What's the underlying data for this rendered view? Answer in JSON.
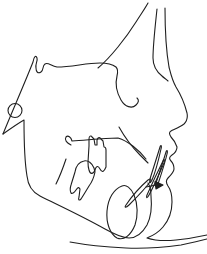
{
  "figure": {
    "kind": "cephalometric-tracing-line-drawing",
    "background_color": "#ffffff",
    "stroke_color": "#1f1f1f",
    "stroke_width": 1.1,
    "width": 207,
    "height": 254,
    "paths": [
      {
        "name": "frontal-bone-inner-curve",
        "d": "M 98 68 C 110 58 126 38 136 22 C 141 14 146 7 148 3"
      },
      {
        "name": "cranial-base-sella-orbital-outline",
        "d": "M 3 134 C 12 112 26 80 33 62 C 34 56 36 55 37 58 C 38 61 35 64 36 68 C 36 72 38 74 41 72 C 44 70 42 66 45 64 C 48 62 51 66 57 67 C 72 67 86 63 100 63 C 107 63 112 64 116 67 C 118 69 118 72 117 76 C 115 84 117 93 121 100 C 125 107 132 109 136 105 C 139 102 139 100 137 98"
      },
      {
        "name": "condyle-ramus-mandible-lower-border",
        "d": "M 3 134 C 10 129 17 124 24 120 C 24 138 24 158 27 176 C 28 186 32 192 40 196 C 58 205 82 216 105 229 C 114 234 122 238 129 238 C 137 238 143 232 147 225 C 151 217 152 206 151 196 C 151 190 150 186 148 183"
      },
      {
        "name": "symphysis-outline",
        "d": "M 122 186 C 114 189 108 198 107 211 C 106 223 110 234 117 238 C 124 241 131 235 135 225 C 138 216 138 204 134 195 C 131 188 126 184 122 186"
      },
      {
        "name": "lower-incisor-outline",
        "d": "M 126 205 C 132 196 140 187 148 180 C 151 178 152 179 150 182 C 145 189 136 198 129 205 C 126 208 124 208 126 205"
      },
      {
        "name": "upper-incisor-outline-a",
        "d": "M 160 147 C 157 157 153 169 150 179 C 149 183 150 184 152 180 C 156 171 159 158 161 149 C 162 146 161 144 160 147"
      },
      {
        "name": "upper-incisor-outline-b",
        "d": "M 166 152 C 163 162 159 174 156 183 C 155 187 156 188 158 184 C 161 175 165 163 167 154 C 168 151 167 149 166 152"
      },
      {
        "name": "lower-incisor-outline-b",
        "d": "M 163 161 C 157 173 151 186 147 195 C 146 198 147 199 149 195 C 154 186 160 172 164 163 C 165 160 164 158 163 161"
      },
      {
        "name": "incisor-arrow-shaft",
        "d": "M 146 187 L 156 185"
      },
      {
        "name": "anterior-maxilla-line",
        "d": "M 119 127 C 124 136 132 147 140 155 C 143 158 146 161 148 163"
      },
      {
        "name": "palatal-line-with-hook",
        "d": "M 71 145 C 67 143 64 140 66 137 C 68 135 71 137 72 141 C 88 140 103 138 118 138 C 128 141 139 150 146 159"
      },
      {
        "name": "upper-molar-outline",
        "d": "M 89 146 L 89 139 C 89 136 91 135 92 137 L 94 139 L 95 145 L 97 145 L 97 140 C 98 137 100 137 101 139 L 103 141 L 104 147 C 105 147 106 148 106 150 L 106 167 C 104 172 102 173 100 169 C 98 165 96 166 95 170 C 93 175 90 174 89 170 C 88 167 88 165 88 162 L 89 146"
      },
      {
        "name": "lower-molar-outline",
        "d": "M 75 172 C 76 166 79 162 84 161 C 88 160 92 163 94 168 L 95 172 C 94 177 92 182 89 186 C 86 191 83 196 81 199 C 79 201 78 200 79 197 L 80 189 C 79 187 78 187 76 190 C 74 193 72 194 71 193 C 70 191 70 188 71 185 L 75 172"
      },
      {
        "name": "oblique-ridge-line",
        "d": "M 56 184 C 60 176 63 168 66 159"
      },
      {
        "name": "soft-tissue-profile",
        "d": "M 165 8 C 165 30 166 50 169 67 C 171 75 172 80 176 87 C 181 95 185 105 187 113 C 188 118 187 121 184 124 C 180 127 175 129 171 131 C 169 132 169 134 171 137 C 174 140 176 144 177 147 C 177 151 175 153 172 155 C 169 157 169 159 171 161 C 173 163 174 166 174 169 C 174 172 171 175 168 178 C 166 180 166 183 168 186 C 171 190 172 196 172 202 C 172 211 169 220 163 227 C 158 233 152 236 147 238 C 156 241 166 241 176 240 C 187 239 198 237 207 235"
      },
      {
        "name": "forehead-inner-line",
        "d": "M 157 9 C 155 28 153 45 153 58 C 153 66 157 72 162 76 C 164 78 166 79 168 81"
      },
      {
        "name": "neck-line",
        "d": "M 70 242 C 86 245 106 247 126 248 C 146 249 166 247 181 245 C 191 243 200 241 207 239"
      }
    ],
    "circles": [
      {
        "name": "ear-rod-marker",
        "cx": 15,
        "cy": 110.5,
        "r": 7
      }
    ],
    "polygons": [
      {
        "name": "incisor-arrowhead",
        "points": "155,181.5 163,185 156,189",
        "filled": true
      }
    ]
  }
}
